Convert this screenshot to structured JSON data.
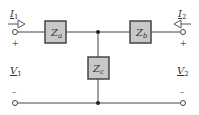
{
  "diagram": {
    "type": "T-network two-port circuit",
    "impedances": [
      {
        "id": "za",
        "label": "Z",
        "sub": "a"
      },
      {
        "id": "zb",
        "label": "Z",
        "sub": "b"
      },
      {
        "id": "zc",
        "label": "Z",
        "sub": "c"
      }
    ],
    "port1": {
      "current_label": "I",
      "current_sub": "1",
      "voltage_label": "V",
      "voltage_sub": "1",
      "plus": "+",
      "minus": "–"
    },
    "port2": {
      "current_label": "I",
      "current_sub": "2",
      "voltage_label": "V",
      "voltage_sub": "2",
      "plus": "+",
      "minus": "–"
    },
    "colors": {
      "wire": "#444444",
      "box_fill": "#c8c8c8",
      "box_stroke": "#444444",
      "background": "#ffffff"
    }
  }
}
